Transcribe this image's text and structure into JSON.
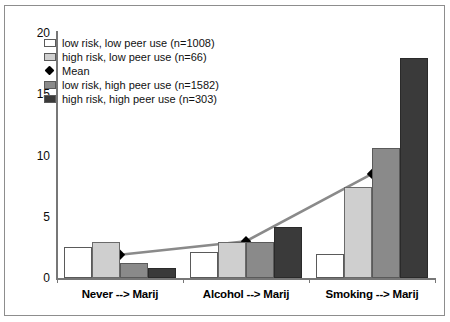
{
  "chart_data": {
    "type": "bar",
    "title": "",
    "xlabel": "",
    "ylabel": "",
    "ylim": [
      0,
      20
    ],
    "yticks": [
      0,
      5,
      10,
      15,
      20
    ],
    "grid": false,
    "legend_position": "upper-left-inside",
    "categories": [
      "Never --> Marij",
      "Alcohol --> Marij",
      "Smoking --> Marij"
    ],
    "series": [
      {
        "name": "low risk, low peer use (n=1008)",
        "n": 1008,
        "color": "#ffffff",
        "values": [
          2.5,
          2.1,
          2.0
        ]
      },
      {
        "name": "high risk, low peer use (n=66)",
        "n": 66,
        "color": "#cfcfcf",
        "values": [
          2.9,
          2.9,
          7.4
        ]
      },
      {
        "name": "low risk, high peer use (n=1582)",
        "n": 1582,
        "color": "#8a8a8a",
        "values": [
          1.2,
          2.9,
          10.6
        ]
      },
      {
        "name": "high risk, high peer use (n=303)",
        "n": 303,
        "color": "#3a3a3a",
        "values": [
          0.8,
          4.2,
          18.0
        ]
      }
    ],
    "overlay": {
      "name": "Mean",
      "type": "line",
      "marker": "diamond",
      "line_color": "#8a8a8a",
      "marker_color": "#000000",
      "values": [
        1.9,
        3.0,
        8.5
      ]
    }
  },
  "axis": {
    "y_tick_labels": [
      "20",
      "15",
      "10",
      "5",
      "0"
    ]
  },
  "legend": {
    "entries": [
      {
        "label": "low risk, low peer use (n=1008)",
        "kind": "swatch",
        "swatch_class": "s0"
      },
      {
        "label": "high risk, low peer use (n=66)",
        "kind": "swatch",
        "swatch_class": "s1"
      },
      {
        "label": "Mean",
        "kind": "mean",
        "swatch_class": ""
      },
      {
        "label": "low risk, high peer use (n=1582)",
        "kind": "swatch",
        "swatch_class": "s2"
      },
      {
        "label": "high risk, high peer use (n=303)",
        "kind": "swatch",
        "swatch_class": "s3"
      }
    ]
  }
}
